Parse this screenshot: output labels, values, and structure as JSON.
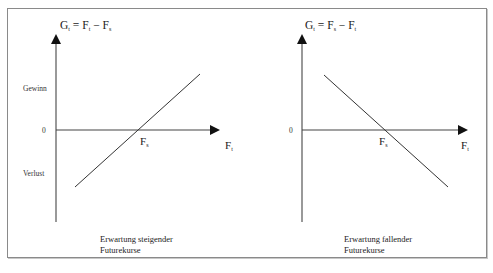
{
  "colors": {
    "frame": "#8a8a8a",
    "ink": "#1a1a1a",
    "background": "#ffffff"
  },
  "left_panel": {
    "formula": {
      "main": "G",
      "main_sub": "t",
      "eq": " = F",
      "first_sub": "t",
      "minus": " − F",
      "second_sub": "s"
    },
    "y_labels": {
      "gain": "Gewinn",
      "zero": "0",
      "loss": "Verlust"
    },
    "x_axis_label": {
      "main": "F",
      "sub": "t"
    },
    "intersection_label": {
      "main": "F",
      "sub": "s"
    },
    "caption_line1": "Erwartung steigender",
    "caption_line2": "Futurekurse",
    "payoff_direction": "rising"
  },
  "right_panel": {
    "formula": {
      "main": "G",
      "main_sub": "t",
      "eq": " = F",
      "first_sub": "s",
      "minus": " − F",
      "second_sub": "t"
    },
    "y_labels": {
      "zero": "0"
    },
    "x_axis_label": {
      "main": "F",
      "sub": "t"
    },
    "intersection_label": {
      "main": "F",
      "sub": "s"
    },
    "caption_line1": "Erwartung fallender",
    "caption_line2": "Futurekurse",
    "payoff_direction": "falling"
  }
}
